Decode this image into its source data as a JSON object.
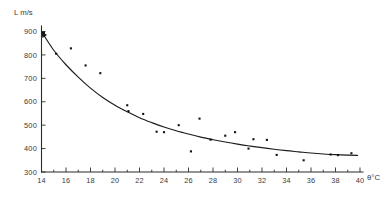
{
  "chart_data": {
    "type": "scatter",
    "title": "",
    "subtitle": "",
    "xlabel": "θ°C",
    "ylabel": "L m/s",
    "xlim": [
      14,
      40
    ],
    "ylim": [
      300,
      900
    ],
    "grid": false,
    "legend": null,
    "xticks": [
      14,
      16,
      18,
      20,
      22,
      24,
      26,
      28,
      30,
      32,
      34,
      36,
      38,
      40
    ],
    "xtick_labels": [
      "14",
      "16",
      "18",
      "20",
      "22",
      "24",
      "26",
      "28",
      "30",
      "32",
      "34",
      "36",
      "38",
      "40"
    ],
    "xminor_step": 1,
    "yticks": [
      300,
      400,
      500,
      600,
      700,
      800,
      900
    ],
    "ytick_labels": [
      "300",
      "400",
      "500",
      "600",
      "700",
      "800",
      "900"
    ],
    "series": [
      {
        "name": "measurements",
        "type": "scatter",
        "marker": "square",
        "color": "#121212",
        "points": [
          {
            "x": 14.2,
            "y": 895
          },
          {
            "x": 15.2,
            "y": 805
          },
          {
            "x": 16.4,
            "y": 828
          },
          {
            "x": 17.6,
            "y": 755
          },
          {
            "x": 18.8,
            "y": 722
          },
          {
            "x": 21.0,
            "y": 585
          },
          {
            "x": 21.1,
            "y": 560
          },
          {
            "x": 22.3,
            "y": 548
          },
          {
            "x": 23.4,
            "y": 472
          },
          {
            "x": 24.0,
            "y": 470
          },
          {
            "x": 25.2,
            "y": 500
          },
          {
            "x": 26.2,
            "y": 388
          },
          {
            "x": 26.9,
            "y": 528
          },
          {
            "x": 27.8,
            "y": 438
          },
          {
            "x": 29.0,
            "y": 455
          },
          {
            "x": 29.8,
            "y": 470
          },
          {
            "x": 30.9,
            "y": 400
          },
          {
            "x": 31.3,
            "y": 440
          },
          {
            "x": 32.4,
            "y": 437
          },
          {
            "x": 33.2,
            "y": 373
          },
          {
            "x": 35.4,
            "y": 350
          },
          {
            "x": 37.6,
            "y": 375
          },
          {
            "x": 38.2,
            "y": 372
          },
          {
            "x": 39.3,
            "y": 380
          }
        ]
      },
      {
        "name": "fitted-curve",
        "type": "line",
        "color": "#1c1c1c",
        "points": [
          {
            "x": 14.0,
            "y": 900
          },
          {
            "x": 15.0,
            "y": 820
          },
          {
            "x": 16.0,
            "y": 758
          },
          {
            "x": 17.0,
            "y": 705
          },
          {
            "x": 18.0,
            "y": 658
          },
          {
            "x": 19.0,
            "y": 618
          },
          {
            "x": 20.0,
            "y": 585
          },
          {
            "x": 21.0,
            "y": 557
          },
          {
            "x": 22.0,
            "y": 532
          },
          {
            "x": 23.0,
            "y": 511
          },
          {
            "x": 24.0,
            "y": 492
          },
          {
            "x": 25.0,
            "y": 476
          },
          {
            "x": 26.0,
            "y": 462
          },
          {
            "x": 27.0,
            "y": 449
          },
          {
            "x": 28.0,
            "y": 438
          },
          {
            "x": 29.0,
            "y": 428
          },
          {
            "x": 30.0,
            "y": 419
          },
          {
            "x": 31.0,
            "y": 411
          },
          {
            "x": 32.0,
            "y": 404
          },
          {
            "x": 33.0,
            "y": 397
          },
          {
            "x": 34.0,
            "y": 391
          },
          {
            "x": 35.0,
            "y": 386
          },
          {
            "x": 36.0,
            "y": 381
          },
          {
            "x": 37.0,
            "y": 377
          },
          {
            "x": 38.0,
            "y": 374
          },
          {
            "x": 39.0,
            "y": 372
          },
          {
            "x": 39.8,
            "y": 371
          }
        ]
      }
    ],
    "annotations": [
      {
        "name": "curve-start-arrow",
        "x": 14.0,
        "y": 900,
        "kind": "arrowhead"
      }
    ]
  },
  "axes": {
    "y_title": "L m/s",
    "x_title": "θ°C"
  }
}
